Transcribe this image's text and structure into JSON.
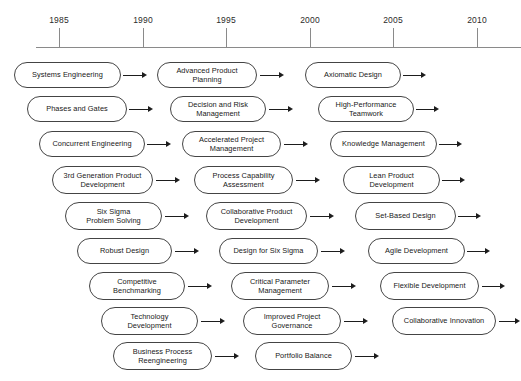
{
  "diagram": {
    "axis": {
      "name": "year-axis",
      "ticks": [
        {
          "label": "1985",
          "x": 59
        },
        {
          "label": "1990",
          "x": 143
        },
        {
          "label": "1995",
          "x": 226
        },
        {
          "label": "2000",
          "x": 310
        },
        {
          "label": "2005",
          "x": 393
        },
        {
          "label": "2010",
          "x": 477
        }
      ],
      "line": {
        "x": 36,
        "y": 47,
        "width": 485
      },
      "tick_top": 28,
      "tick_height": 19,
      "label_y": 15
    },
    "colors": {
      "axis": "#8a8a8a",
      "node_border": "#444444",
      "node_fill": "#ffffff",
      "arrow": "#1d1d1d",
      "text": "#181818",
      "background": "#ffffff"
    },
    "rows": [
      {
        "index": 0,
        "y": 62,
        "height": 26,
        "nodes": [
          {
            "name": "node-systems-engineering",
            "label": "Systems Engineering",
            "lines": [
              "Systems Engineering"
            ],
            "x": 14,
            "width": 107,
            "arrow_x": 123,
            "arrow_len": 24
          },
          {
            "name": "node-advanced-product-planning",
            "label": "Advanced Product Planning",
            "lines": [
              "Advanced Product",
              "Planning"
            ],
            "x": 157,
            "width": 100,
            "arrow_x": 260,
            "arrow_len": 24
          },
          {
            "name": "node-axiomatic-design",
            "label": "Axiomatic Design",
            "lines": [
              "Axiomatic Design"
            ],
            "x": 305,
            "width": 96,
            "arrow_x": 403,
            "arrow_len": 23
          }
        ]
      },
      {
        "index": 1,
        "y": 96,
        "height": 26,
        "nodes": [
          {
            "name": "node-phases-and-gates",
            "label": "Phases and Gates",
            "lines": [
              "Phases and Gates"
            ],
            "x": 27,
            "width": 100,
            "arrow_x": 129,
            "arrow_len": 24
          },
          {
            "name": "node-decision-and-risk-management",
            "label": "Decision and Risk Management",
            "lines": [
              "Decision and Risk",
              "Management"
            ],
            "x": 170,
            "width": 96,
            "arrow_x": 269,
            "arrow_len": 24
          },
          {
            "name": "node-high-performance-teamwork",
            "label": "High-Performance Teamwork",
            "lines": [
              "High-Performance",
              "Teamwork"
            ],
            "x": 318,
            "width": 96,
            "arrow_x": 416,
            "arrow_len": 23
          }
        ]
      },
      {
        "index": 2,
        "y": 131,
        "height": 26,
        "nodes": [
          {
            "name": "node-concurrent-engineering",
            "label": "Concurrent Engineering",
            "lines": [
              "Concurrent Engineering"
            ],
            "x": 39,
            "width": 106,
            "arrow_x": 147,
            "arrow_len": 24
          },
          {
            "name": "node-accelerated-project-management",
            "label": "Accelerated Project Management",
            "lines": [
              "Accelerated Project",
              "Management"
            ],
            "x": 182,
            "width": 99,
            "arrow_x": 284,
            "arrow_len": 24
          },
          {
            "name": "node-knowledge-management",
            "label": "Knowledge Management",
            "lines": [
              "Knowledge Management"
            ],
            "x": 330,
            "width": 107,
            "arrow_x": 439,
            "arrow_len": 23
          }
        ]
      },
      {
        "index": 3,
        "y": 166,
        "height": 28,
        "nodes": [
          {
            "name": "node-3rd-generation-product-development",
            "label": "3rd Generation Product Development",
            "lines": [
              "3rd Generation Product",
              "Development"
            ],
            "x": 52,
            "width": 101,
            "arrow_x": 156,
            "arrow_len": 24
          },
          {
            "name": "node-process-capability-assessment",
            "label": "Process Capability Assessment",
            "lines": [
              "Process Capability",
              "Assessment"
            ],
            "x": 194,
            "width": 99,
            "arrow_x": 296,
            "arrow_len": 24
          },
          {
            "name": "node-lean-product-development",
            "label": "Lean Product Development",
            "lines": [
              "Lean Product",
              "Development"
            ],
            "x": 343,
            "width": 97,
            "arrow_x": 442,
            "arrow_len": 23
          }
        ]
      },
      {
        "index": 4,
        "y": 202,
        "height": 28,
        "nodes": [
          {
            "name": "node-six-sigma-problem-solving",
            "label": "Six Sigma Problem Solving",
            "lines": [
              "Six Sigma",
              "Problem Solving"
            ],
            "x": 65,
            "width": 97,
            "arrow_x": 165,
            "arrow_len": 24
          },
          {
            "name": "node-collaborative-product-development",
            "label": "Collaborative Product Development",
            "lines": [
              "Collaborative Product",
              "Development"
            ],
            "x": 206,
            "width": 101,
            "arrow_x": 310,
            "arrow_len": 24
          },
          {
            "name": "node-set-based-design",
            "label": "Set-Based Design",
            "lines": [
              "Set-Based Design"
            ],
            "x": 355,
            "width": 101,
            "arrow_x": 458,
            "arrow_len": 23
          }
        ]
      },
      {
        "index": 5,
        "y": 238,
        "height": 26,
        "nodes": [
          {
            "name": "node-robust-design",
            "label": "Robust Design",
            "lines": [
              "Robust Design"
            ],
            "x": 77,
            "width": 95,
            "arrow_x": 175,
            "arrow_len": 24
          },
          {
            "name": "node-design-for-six-sigma",
            "label": "Design for Six Sigma",
            "lines": [
              "Design for Six Sigma"
            ],
            "x": 219,
            "width": 99,
            "arrow_x": 321,
            "arrow_len": 24
          },
          {
            "name": "node-agile-development",
            "label": "Agile Development",
            "lines": [
              "Agile Development"
            ],
            "x": 368,
            "width": 97,
            "arrow_x": 467,
            "arrow_len": 23
          }
        ]
      },
      {
        "index": 6,
        "y": 272,
        "height": 28,
        "nodes": [
          {
            "name": "node-competitive-benchmarking",
            "label": "Competitive Benchmarking",
            "lines": [
              "Competitive",
              "Benchmarking"
            ],
            "x": 89,
            "width": 96,
            "arrow_x": 188,
            "arrow_len": 24
          },
          {
            "name": "node-critical-parameter-management",
            "label": "Critical Parameter Management",
            "lines": [
              "Critical Parameter",
              "Management"
            ],
            "x": 231,
            "width": 98,
            "arrow_x": 332,
            "arrow_len": 24
          },
          {
            "name": "node-flexible-development",
            "label": "Flexible Development",
            "lines": [
              "Flexible Development"
            ],
            "x": 380,
            "width": 99,
            "arrow_x": 482,
            "arrow_len": 23
          }
        ]
      },
      {
        "index": 7,
        "y": 307,
        "height": 28,
        "nodes": [
          {
            "name": "node-technology-development",
            "label": "Technology Development",
            "lines": [
              "Technology",
              "Development"
            ],
            "x": 101,
            "width": 97,
            "arrow_x": 201,
            "arrow_len": 24
          },
          {
            "name": "node-improved-project-governance",
            "label": "Improved Project Governance",
            "lines": [
              "Improved Project",
              "Governance"
            ],
            "x": 243,
            "width": 98,
            "arrow_x": 344,
            "arrow_len": 24
          },
          {
            "name": "node-collaborative-innovation",
            "label": "Collaborative Innovation",
            "lines": [
              "Collaborative Innovation"
            ],
            "x": 392,
            "width": 104,
            "arrow_x": 499,
            "arrow_len": 21
          }
        ]
      },
      {
        "index": 8,
        "y": 342,
        "height": 28,
        "nodes": [
          {
            "name": "node-business-process-reengineering",
            "label": "Business Process Reengineering",
            "lines": [
              "Business Process",
              "Reengineering"
            ],
            "x": 113,
            "width": 99,
            "arrow_x": 215,
            "arrow_len": 24
          },
          {
            "name": "node-portfolio-balance",
            "label": "Portfolio Balance",
            "lines": [
              "Portfolio Balance"
            ],
            "x": 255,
            "width": 97,
            "arrow_x": 355,
            "arrow_len": 24
          }
        ]
      }
    ]
  }
}
